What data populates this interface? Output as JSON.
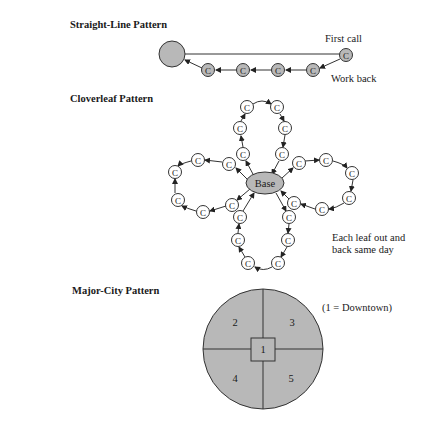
{
  "sections": {
    "straight_line": {
      "title": "Straight-Line Pattern",
      "first_call_label": "First call",
      "work_back_label": "Work back",
      "call_letter": "C"
    },
    "cloverleaf": {
      "title": "Cloverleaf Pattern",
      "base_label": "Base",
      "call_letter": "C",
      "note_line1": "Each leaf out and",
      "note_line2": "back same day"
    },
    "major_city": {
      "title": "Major-City Pattern",
      "legend": "(1 = Downtown)",
      "zones": [
        "1",
        "2",
        "3",
        "4",
        "5"
      ]
    }
  },
  "colors": {
    "fill_gray": "#b8b8b8",
    "stroke": "#333333",
    "background": "#ffffff"
  }
}
